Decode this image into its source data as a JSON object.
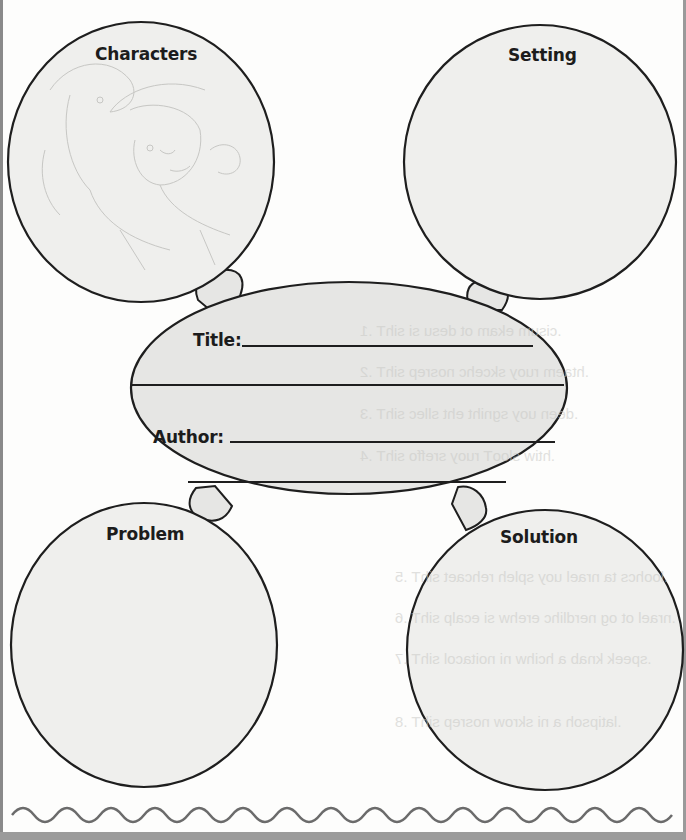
{
  "worksheet": {
    "type": "story map graphic organizer",
    "bubbles": {
      "characters": {
        "label": "Characters"
      },
      "setting": {
        "label": "Setting"
      },
      "problem": {
        "label": "Problem"
      },
      "solution": {
        "label": "Solution"
      }
    },
    "center": {
      "title_label": "Title:",
      "author_label": "Author:",
      "title_value": "",
      "author_value": ""
    },
    "illustration": "faint sketch of two children in hats, one holding binoculars (characters bubble background)",
    "colors": {
      "bubble_fill": "#e6e6e4",
      "outline": "#1e1e1e",
      "wave": "#6b6b6b",
      "page_border": "#8a8a8a"
    }
  }
}
